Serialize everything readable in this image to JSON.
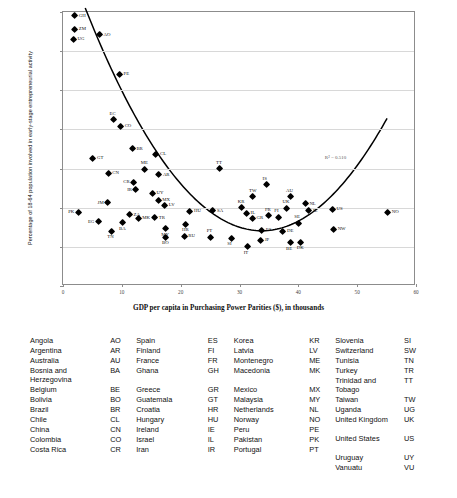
{
  "chart_data": {
    "type": "scatter",
    "title": "",
    "xlabel": "GDP per capita in Purchasing Power Parities ($), in thousands",
    "ylabel": "Percentage of 18-64 population involved in early-stage entrepreneurial activity",
    "xlim": [
      0,
      60
    ],
    "ylim": [
      0,
      35
    ],
    "xticks": [
      0,
      10,
      20,
      30,
      40,
      50,
      60
    ],
    "yticks": [
      0,
      5,
      10,
      15,
      20,
      25,
      30,
      35
    ],
    "grid": "horizontal",
    "legend": "none",
    "annotation": "R² = 0.510",
    "trendline": {
      "type": "quadratic-fit",
      "description": "U-shaped curve descending from ~27 at x=4 to minimum ~7 near x=34 then rising to ~20 at x=55"
    },
    "points": [
      {
        "code": "GH",
        "x": 2.0,
        "y": 34.5,
        "side": "lr"
      },
      {
        "code": "ZM",
        "x": 2.0,
        "y": 32.8,
        "side": "lr"
      },
      {
        "code": "UG",
        "x": 1.8,
        "y": 31.5,
        "side": "lr"
      },
      {
        "code": "AO",
        "x": 6.2,
        "y": 32.1,
        "side": "lr"
      },
      {
        "code": "PE",
        "x": 9.6,
        "y": 27.0,
        "side": "lr"
      },
      {
        "code": "EC",
        "x": 8.6,
        "y": 21.2,
        "side": "lt"
      },
      {
        "code": "CO",
        "x": 9.8,
        "y": 20.4,
        "side": "lr"
      },
      {
        "code": "BR",
        "x": 11.8,
        "y": 17.5,
        "side": "lr"
      },
      {
        "code": "CL",
        "x": 15.8,
        "y": 16.8,
        "side": "lr"
      },
      {
        "code": "GT",
        "x": 5.1,
        "y": 16.3,
        "side": "lr"
      },
      {
        "code": "ME",
        "x": 13.9,
        "y": 14.9,
        "side": "lt"
      },
      {
        "code": "TT",
        "x": 26.7,
        "y": 15.0,
        "side": "lt"
      },
      {
        "code": "CN",
        "x": 7.7,
        "y": 14.4,
        "side": "lr"
      },
      {
        "code": "AR",
        "x": 16.3,
        "y": 14.2,
        "side": "lr"
      },
      {
        "code": "CR",
        "x": 12.0,
        "y": 13.2,
        "side": "ll"
      },
      {
        "code": "IR",
        "x": 12.4,
        "y": 12.3,
        "side": "ll"
      },
      {
        "code": "UY",
        "x": 15.2,
        "y": 11.8,
        "side": "lr"
      },
      {
        "code": "MX",
        "x": 16.2,
        "y": 10.9,
        "side": "lr"
      },
      {
        "code": "LV",
        "x": 17.3,
        "y": 10.3,
        "side": "lr"
      },
      {
        "code": "JM",
        "x": 7.6,
        "y": 10.6,
        "side": "ll"
      },
      {
        "code": "ZA",
        "x": 11.3,
        "y": 9.1,
        "side": "lr"
      },
      {
        "code": "PK",
        "x": 2.6,
        "y": 9.4,
        "side": "ll"
      },
      {
        "code": "SA",
        "x": 25.5,
        "y": 9.6,
        "side": "lr"
      },
      {
        "code": "MK",
        "x": 12.8,
        "y": 8.6,
        "side": "lr"
      },
      {
        "code": "TR",
        "x": 15.6,
        "y": 8.7,
        "side": "lr"
      },
      {
        "code": "BA",
        "x": 10.2,
        "y": 8.1,
        "side": "lb"
      },
      {
        "code": "EG",
        "x": 6.0,
        "y": 8.2,
        "side": "ll"
      },
      {
        "code": "TN",
        "x": 8.2,
        "y": 7.0,
        "side": "lb"
      },
      {
        "code": "MY",
        "x": 17.4,
        "y": 7.3,
        "side": "lb"
      },
      {
        "code": "BO",
        "x": 17.5,
        "y": 6.2,
        "side": "lb"
      },
      {
        "code": "HU",
        "x": 21.6,
        "y": 9.5,
        "side": "lr"
      },
      {
        "code": "HR",
        "x": 20.9,
        "y": 7.9,
        "side": "lb"
      },
      {
        "code": "RU",
        "x": 20.6,
        "y": 6.3,
        "side": "lr"
      },
      {
        "code": "PT",
        "x": 25.1,
        "y": 6.2,
        "side": "lt"
      },
      {
        "code": "SI",
        "x": 28.6,
        "y": 6.1,
        "side": "lb"
      },
      {
        "code": "IT",
        "x": 31.4,
        "y": 5.0,
        "side": "lb"
      },
      {
        "code": "KR",
        "x": 30.4,
        "y": 10.0,
        "side": "lt"
      },
      {
        "code": "IL",
        "x": 31.2,
        "y": 9.3,
        "side": "lr"
      },
      {
        "code": "GR",
        "x": 32.2,
        "y": 8.6,
        "side": "lr"
      },
      {
        "code": "FR",
        "x": 35.0,
        "y": 9.0,
        "side": "lt"
      },
      {
        "code": "FI",
        "x": 36.6,
        "y": 8.8,
        "side": "lt"
      },
      {
        "code": "UK",
        "x": 38.0,
        "y": 9.9,
        "side": "lt"
      },
      {
        "code": "ES",
        "x": 33.8,
        "y": 7.1,
        "side": "lr"
      },
      {
        "code": "JP",
        "x": 33.6,
        "y": 5.8,
        "side": "lr"
      },
      {
        "code": "DE",
        "x": 37.4,
        "y": 7.0,
        "side": "lr"
      },
      {
        "code": "BE",
        "x": 38.6,
        "y": 5.5,
        "side": "lb"
      },
      {
        "code": "DK",
        "x": 40.4,
        "y": 5.6,
        "side": "lb"
      },
      {
        "code": "SE",
        "x": 40.0,
        "y": 8.0,
        "side": "lt"
      },
      {
        "code": "IS",
        "x": 34.6,
        "y": 12.9,
        "side": "lt"
      },
      {
        "code": "TW",
        "x": 32.3,
        "y": 11.4,
        "side": "lt"
      },
      {
        "code": "AU",
        "x": 38.6,
        "y": 11.4,
        "side": "lt"
      },
      {
        "code": "NL",
        "x": 41.2,
        "y": 10.5,
        "side": "lr"
      },
      {
        "code": "IE",
        "x": 41.8,
        "y": 9.6,
        "side": "lr"
      },
      {
        "code": "US",
        "x": 45.8,
        "y": 9.8,
        "side": "lr"
      },
      {
        "code": "NW",
        "x": 46.0,
        "y": 7.2,
        "side": "lr"
      },
      {
        "code": "NO",
        "x": 55.2,
        "y": 9.4,
        "side": "lr"
      }
    ]
  },
  "legend": {
    "columns": [
      {
        "rows": [
          {
            "name": "Angola",
            "code": "AO",
            "tall": false
          },
          {
            "name": "Argentina",
            "code": "AR",
            "tall": false
          },
          {
            "name": "Australia",
            "code": "AU",
            "tall": false
          },
          {
            "name": "Bosnia and Herzegovina",
            "code": "BA",
            "tall": true
          },
          {
            "name": "Belgium",
            "code": "BE",
            "tall": false
          },
          {
            "name": "Bolivia",
            "code": "BO",
            "tall": false
          },
          {
            "name": "Brazil",
            "code": "BR",
            "tall": false
          },
          {
            "name": "Chile",
            "code": "CL",
            "tall": false
          },
          {
            "name": "China",
            "code": "CN",
            "tall": false
          },
          {
            "name": "Colombia",
            "code": "CO",
            "tall": false
          },
          {
            "name": "Costa Rica",
            "code": "CR",
            "tall": false
          }
        ]
      },
      {
        "rows": [
          {
            "name": "Spain",
            "code": "ES",
            "tall": false
          },
          {
            "name": "Finland",
            "code": "FI",
            "tall": false
          },
          {
            "name": "France",
            "code": "FR",
            "tall": false
          },
          {
            "name": "Ghana",
            "code": "GH",
            "tall": true
          },
          {
            "name": "Greece",
            "code": "GR",
            "tall": false
          },
          {
            "name": "Guatemala",
            "code": "GT",
            "tall": false
          },
          {
            "name": "Croatia",
            "code": "HR",
            "tall": false
          },
          {
            "name": "Hungary",
            "code": "HU",
            "tall": false
          },
          {
            "name": "Ireland",
            "code": "IE",
            "tall": false
          },
          {
            "name": "Israel",
            "code": "IL",
            "tall": false
          },
          {
            "name": "Iran",
            "code": "IR",
            "tall": false
          }
        ]
      },
      {
        "rows": [
          {
            "name": "Korea",
            "code": "KR",
            "tall": false
          },
          {
            "name": "Latvia",
            "code": "LV",
            "tall": false
          },
          {
            "name": "Montenegro",
            "code": "ME",
            "tall": false
          },
          {
            "name": "Macedonia",
            "code": "MK",
            "tall": true
          },
          {
            "name": "Mexico",
            "code": "MX",
            "tall": false
          },
          {
            "name": "Malaysia",
            "code": "MY",
            "tall": false
          },
          {
            "name": "Netherlands",
            "code": "NL",
            "tall": false
          },
          {
            "name": "Norway",
            "code": "NO",
            "tall": false
          },
          {
            "name": "Peru",
            "code": "PE",
            "tall": false
          },
          {
            "name": "Pakistan",
            "code": "PK",
            "tall": false
          },
          {
            "name": "Portugal",
            "code": "PT",
            "tall": false
          }
        ]
      },
      {
        "rows": [
          {
            "name": "Slovenia",
            "code": "SI",
            "tall": false
          },
          {
            "name": "Switzerland",
            "code": "SW",
            "tall": false
          },
          {
            "name": "Tunisia",
            "code": "TN",
            "tall": false
          },
          {
            "name": "Turkey",
            "code": "TR",
            "tall": false
          },
          {
            "name": "Trinidad and Tobago",
            "code": "TT",
            "tall": true
          },
          {
            "name": "Taiwan",
            "code": "TW",
            "tall": false
          },
          {
            "name": "Uganda",
            "code": "UG",
            "tall": false
          },
          {
            "name": "United Kingdom",
            "code": "UK",
            "tall": true
          },
          {
            "name": "United States",
            "code": "US",
            "tall": true
          },
          {
            "name": "Uruguay",
            "code": "UY",
            "tall": false
          },
          {
            "name": "Vanuatu",
            "code": "VU",
            "tall": false
          }
        ]
      }
    ]
  }
}
